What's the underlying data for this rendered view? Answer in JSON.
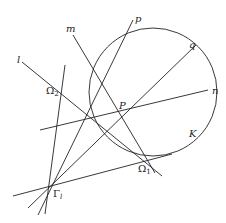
{
  "diagram": {
    "title": "",
    "circle": {
      "label": "K",
      "cx": 153,
      "cy": 92,
      "r": 64
    },
    "points": [
      {
        "name": "P",
        "label": "P",
        "x": 128,
        "y": 112
      },
      {
        "name": "Omega1",
        "label": "Ω",
        "sub": "1",
        "x": 148,
        "y": 159
      },
      {
        "name": "Omega2",
        "label": "Ω",
        "sub": "2",
        "x": 61,
        "y": 91
      },
      {
        "name": "Gamma_l",
        "label": "Γ",
        "sub": "l",
        "x": 48,
        "y": 186
      }
    ],
    "lines": [
      {
        "name": "l",
        "label": "l"
      },
      {
        "name": "m",
        "label": "m"
      },
      {
        "name": "n",
        "label": "n"
      },
      {
        "name": "p",
        "label": "p"
      },
      {
        "name": "q",
        "label": "q"
      }
    ],
    "labels": {
      "l": "l",
      "m": "m",
      "n": "n",
      "p": "p",
      "q": "q",
      "K": "K",
      "P": "P",
      "Omega": "Ω",
      "Omega1_sub": "1",
      "Omega2_sub": "2",
      "Gamma": "Γ",
      "Gamma_sub": "l"
    }
  }
}
